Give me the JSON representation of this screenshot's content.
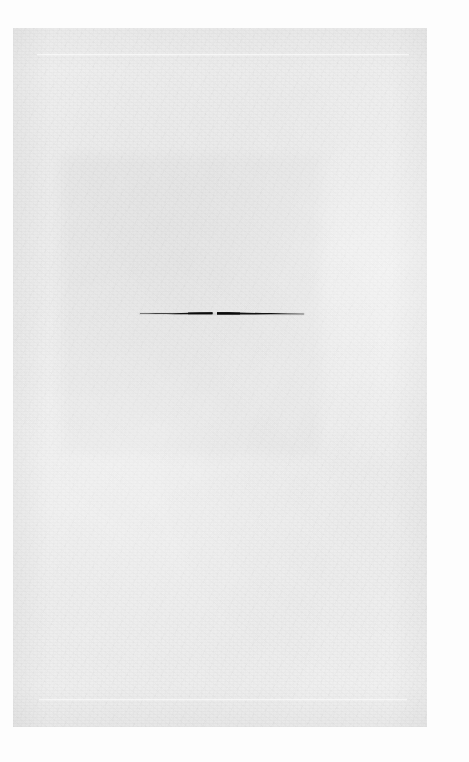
{
  "document": {
    "kind": "scanned-page",
    "content_description": "blank-page",
    "page_width": 469,
    "page_height": 762,
    "background_color": "#fdfdfd",
    "paper_color": "#f2f2f2",
    "ink_color": "#121212"
  },
  "paper": {
    "label": "scanned paper sheet",
    "left": 13,
    "top": 28,
    "width": 414,
    "height": 699
  },
  "rules": [
    {
      "name": "top-rule",
      "label": "faint horizontal rule near top",
      "left": 37,
      "top": 54,
      "width": 372
    },
    {
      "name": "bottom-rule",
      "label": "faint horizontal rule near bottom",
      "left": 39,
      "top": 699,
      "width": 368
    }
  ],
  "ink_stroke": {
    "name": "horizontal-ink-stroke",
    "label": "hand drawn horizontal stroke",
    "shape": "tapered-horizontal-line-with-center-break",
    "left": 140,
    "right": 301,
    "baseline_y": 313,
    "max_thickness": 3,
    "center_gap_x": 213,
    "center_gap_width": 4,
    "color": "#121212"
  },
  "text_content": {
    "visible_text": "",
    "note": "no legible text present on the page"
  }
}
